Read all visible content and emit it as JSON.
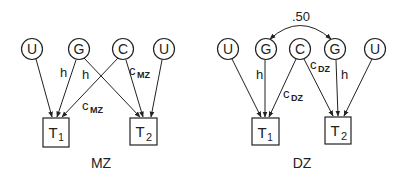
{
  "diagrams": [
    {
      "id": "mz",
      "caption": "MZ",
      "latents": [
        {
          "label": "U",
          "x": 32,
          "y": 49
        },
        {
          "label": "G",
          "x": 79,
          "y": 49
        },
        {
          "label": "C",
          "x": 123,
          "y": 49
        },
        {
          "label": "U",
          "x": 164,
          "y": 49
        }
      ],
      "observed": [
        {
          "label": "T",
          "sub": "1",
          "x": 56,
          "y": 132
        },
        {
          "label": "T",
          "sub": "2",
          "x": 143,
          "y": 132
        }
      ],
      "path_labels": [
        {
          "text": "h",
          "sub": "",
          "x": 60,
          "y": 81
        },
        {
          "text": "h",
          "sub": "",
          "x": 82,
          "y": 80
        },
        {
          "text": "c",
          "sub": "MZ",
          "x": 130,
          "y": 77
        },
        {
          "text": "c",
          "sub": "MZ",
          "x": 82,
          "y": 112
        }
      ]
    },
    {
      "id": "dz",
      "caption": "DZ",
      "correlation": ".50",
      "latents": [
        {
          "label": "U",
          "x": 228,
          "y": 49
        },
        {
          "label": "G",
          "x": 266,
          "y": 49
        },
        {
          "label": "C",
          "x": 300,
          "y": 49
        },
        {
          "label": "G",
          "x": 335,
          "y": 49
        },
        {
          "label": "U",
          "x": 375,
          "y": 49
        }
      ],
      "observed": [
        {
          "label": "T",
          "sub": "1",
          "x": 266,
          "y": 132
        },
        {
          "label": "T",
          "sub": "2",
          "x": 338,
          "y": 130
        }
      ],
      "path_labels": [
        {
          "text": "h",
          "sub": "",
          "x": 256,
          "y": 79
        },
        {
          "text": "h",
          "sub": "",
          "x": 341,
          "y": 79
        },
        {
          "text": "c",
          "sub": "DZ",
          "x": 308,
          "y": 71
        },
        {
          "text": "c",
          "sub": "DZ",
          "x": 282,
          "y": 101
        }
      ]
    }
  ]
}
